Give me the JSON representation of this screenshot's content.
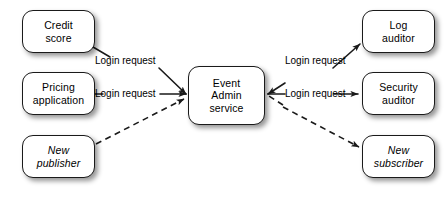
{
  "diagram": {
    "background_color": "#ffffff",
    "line_color": "#1a1a1a",
    "nodes": [
      {
        "id": "credit-score",
        "label": "Credit\nscore",
        "line1": "Credit",
        "line2": "score",
        "style": "normal",
        "column": "left",
        "row": 1
      },
      {
        "id": "pricing-app",
        "label": "Pricing\napplication",
        "line1": "Pricing",
        "line2": "application",
        "style": "normal",
        "column": "left",
        "row": 2
      },
      {
        "id": "new-publisher",
        "label": "New\npublisher",
        "line1": "New",
        "line2": "publisher",
        "style": "italic",
        "column": "left",
        "row": 3
      },
      {
        "id": "event-admin",
        "label": "Event\nAdmin\nservice",
        "line1": "Event",
        "line2": "Admin",
        "line3": "service",
        "style": "normal",
        "column": "center",
        "row": 1
      },
      {
        "id": "log-auditor",
        "label": "Log\nauditor",
        "line1": "Log",
        "line2": "auditor",
        "style": "normal",
        "column": "right",
        "row": 1
      },
      {
        "id": "security-auditor",
        "label": "Security\nauditor",
        "line1": "Security",
        "line2": "auditor",
        "style": "normal",
        "column": "right",
        "row": 2
      },
      {
        "id": "new-subscriber",
        "label": "New\nsubscriber",
        "line1": "New",
        "line2": "subscriber",
        "style": "italic",
        "column": "right",
        "row": 3
      }
    ],
    "edges": [
      {
        "id": "credit-to-admin",
        "from": "credit-score",
        "to": "event-admin",
        "label": "Login request",
        "line_style": "solid",
        "arrow": "end"
      },
      {
        "id": "pricing-to-admin",
        "from": "pricing-app",
        "to": "event-admin",
        "label": "Login request",
        "line_style": "solid",
        "arrow": "end"
      },
      {
        "id": "publisher-to-admin",
        "from": "new-publisher",
        "to": "event-admin",
        "label": "",
        "line_style": "dashed",
        "arrow": "end"
      },
      {
        "id": "admin-to-log",
        "from": "event-admin",
        "to": "log-auditor",
        "label": "Login request",
        "line_style": "solid",
        "arrow": "end"
      },
      {
        "id": "admin-to-security",
        "from": "event-admin",
        "to": "security-auditor",
        "label": "Login request",
        "line_style": "solid",
        "arrow": "end"
      },
      {
        "id": "admin-to-subscriber",
        "from": "event-admin",
        "to": "new-subscriber",
        "label": "",
        "line_style": "dashed",
        "arrow": "end"
      }
    ],
    "edge_labels": {
      "credit_to_admin": "Login request",
      "pricing_to_admin": "Login request",
      "admin_to_log": "Login request",
      "admin_to_security": "Login request"
    }
  }
}
